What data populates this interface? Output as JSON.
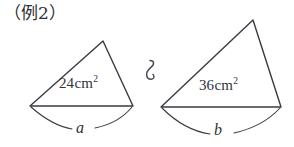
{
  "figure": {
    "heading": "（例2）",
    "relation_symbol": "∽",
    "relation_symbol_name": "similar-to-symbol",
    "stroke_color": "#3a3a42",
    "text_color": "#33333b",
    "background_color": "#ffffff",
    "shapes": [
      {
        "id": "left-triangle",
        "area_value": "24",
        "area_unit": "cm",
        "area_exponent": "2",
        "base_label": "a",
        "points": "30,106 133,106 103,41",
        "arc_path_left": "M 31,107 C 48,122 60,127 72,129",
        "arc_path_right": "M 95,128 C 110,125 123,118 132,107"
      },
      {
        "id": "right-triangle",
        "area_value": "36",
        "area_unit": "cm",
        "area_exponent": "2",
        "base_label": "b",
        "points": "161,107 281,107 253,20",
        "arc_path_left": "M 162,108 C 180,126 196,132 210,134",
        "arc_path_right": "M 234,133 C 252,129 268,121 280,108"
      }
    ]
  }
}
